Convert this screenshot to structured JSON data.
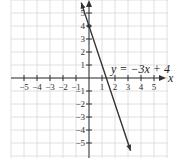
{
  "chart_data": {
    "type": "line",
    "title": "",
    "xlabel": "x",
    "ylabel": "",
    "xlim": [
      -6,
      6
    ],
    "ylim": [
      -6,
      6
    ],
    "grid": true,
    "x_ticks": [
      -5,
      -4,
      -3,
      -2,
      -1,
      1,
      2,
      3,
      4,
      5
    ],
    "y_ticks": [
      -5,
      -4,
      -3,
      -2,
      -1,
      1,
      2,
      3,
      4,
      5
    ],
    "x_tick_labels": [
      "−5",
      "−4",
      "−3",
      "−2",
      "−1",
      "1",
      "2",
      "3",
      "4",
      "5"
    ],
    "y_tick_labels": [
      "−5",
      "−4",
      "−3",
      "−2",
      "−1",
      "1",
      "2",
      "3",
      "4",
      "5"
    ],
    "series": [
      {
        "name": "y = −3x + 4",
        "slope": -3,
        "intercept": 4,
        "x": [
          -0.6,
          0,
          1,
          2,
          3.2
        ],
        "y": [
          5.8,
          4,
          1,
          -2,
          -5.6
        ]
      }
    ],
    "points": [
      {
        "x": 0,
        "y": 4,
        "label": "y-intercept"
      }
    ],
    "annotations": [
      {
        "text": "y = −3x + 4",
        "x": 1.8,
        "y": 1.5
      }
    ]
  },
  "labels": {
    "equation": "y = −3x + 4",
    "x_axis": "x"
  },
  "colors": {
    "grid": "#d8d8d8",
    "axis": "#333333",
    "line": "#333333"
  }
}
